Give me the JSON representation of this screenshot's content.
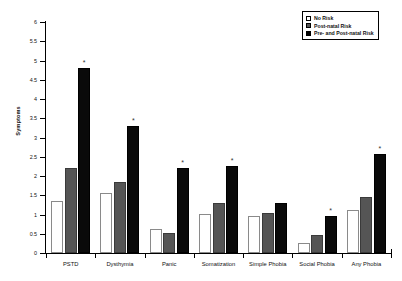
{
  "chart_data": {
    "type": "bar",
    "title": "",
    "xlabel": "",
    "ylabel": "Symptoms",
    "ylim": [
      0,
      6
    ],
    "ytick_labels": [
      "0",
      "0.5",
      "1",
      "1.5",
      "2",
      "2.5",
      "3",
      "3.5",
      "4",
      "4.5",
      "5",
      "5.5",
      "6"
    ],
    "ytick_values": [
      0,
      0.5,
      1,
      1.5,
      2,
      2.5,
      3,
      3.5,
      4,
      4.5,
      5,
      5.5,
      6
    ],
    "grid": false,
    "legend_position": "top-right",
    "categories": [
      "PSTD",
      "Dysthymia",
      "Panic",
      "Somatization",
      "Simple Phobia",
      "Social Phobia",
      "Any Phobia"
    ],
    "series": [
      {
        "name": "No Risk",
        "color": "#ffffff",
        "values": [
          1.35,
          1.55,
          0.62,
          1.02,
          0.95,
          0.27,
          1.12
        ],
        "significance": [
          "",
          "",
          "",
          "",
          "",
          "",
          ""
        ]
      },
      {
        "name": "Post-natal Risk",
        "color": "#555555",
        "values": [
          2.2,
          1.85,
          0.52,
          1.3,
          1.05,
          0.48,
          1.45
        ],
        "significance": [
          "",
          "",
          "",
          "",
          "",
          "",
          ""
        ]
      },
      {
        "name": "Pre- and Post-natal Risk",
        "color": "#000000",
        "values": [
          4.8,
          3.3,
          2.2,
          2.25,
          1.3,
          0.97,
          2.58
        ],
        "significance": [
          "*",
          "*",
          "*",
          "*",
          "",
          "*",
          "*"
        ]
      }
    ],
    "annotation_note": "* denotes significance marker above bar"
  }
}
